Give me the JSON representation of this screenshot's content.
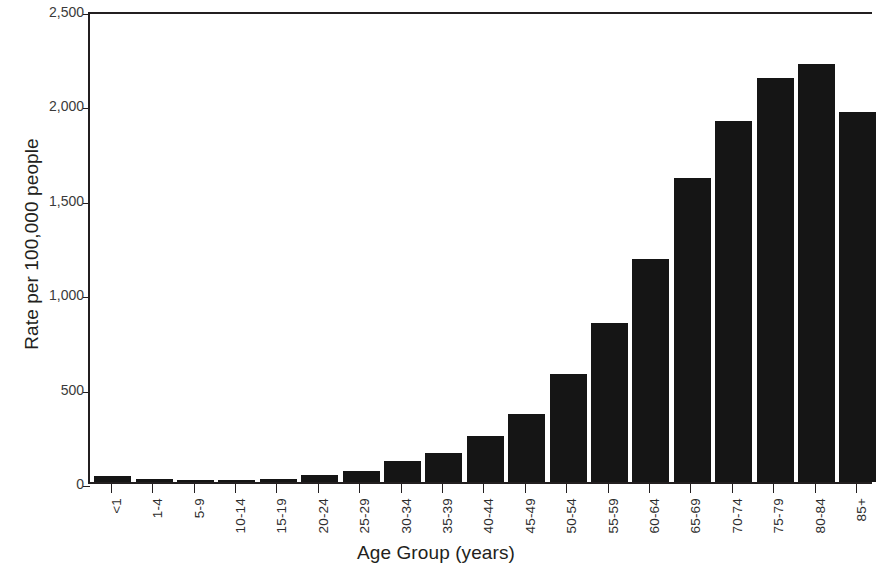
{
  "chart_data": {
    "type": "bar",
    "title": "",
    "xlabel": "Age Group (years)",
    "ylabel": "Rate per 100,000 people",
    "categories": [
      "<1",
      "1-4",
      "5-9",
      "10-14",
      "15-19",
      "20-24",
      "25-29",
      "30-34",
      "35-39",
      "40-44",
      "45-49",
      "50-54",
      "55-59",
      "60-64",
      "65-69",
      "70-74",
      "75-79",
      "80-84",
      "85+"
    ],
    "values": [
      30,
      15,
      8,
      10,
      15,
      35,
      60,
      110,
      155,
      245,
      360,
      570,
      840,
      1180,
      1610,
      1910,
      2140,
      2215,
      1960
    ],
    "ylim": [
      0,
      2500
    ],
    "xlim_note": "rightmost bar (85+) is clipped by the image edge",
    "y_ticks": [
      0,
      500,
      1000,
      1500,
      2000,
      2500
    ],
    "y_tick_labels": [
      "0",
      "500",
      "1,000",
      "1,500",
      "2,000",
      "2,500"
    ],
    "grid": false,
    "legend": null,
    "bar_color": "#151515",
    "axis_color": "#231f20"
  }
}
